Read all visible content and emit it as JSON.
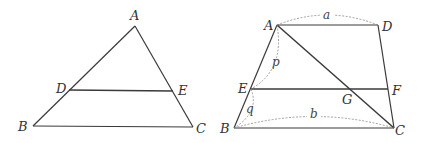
{
  "figures": [
    {
      "name": "triangle-ABC",
      "points": {
        "A": [
          135,
          26
        ],
        "B": [
          33,
          126
        ],
        "C": [
          193,
          127
        ],
        "D": [
          69,
          90
        ],
        "E": [
          173,
          91
        ]
      },
      "labels": {
        "A": "A",
        "B": "B",
        "C": "C",
        "D": "D",
        "E": "E"
      },
      "segments": [
        [
          "A",
          "B"
        ],
        [
          "A",
          "C"
        ],
        [
          "B",
          "C"
        ],
        [
          "D",
          "E"
        ]
      ]
    },
    {
      "name": "trapezoid-ABCD",
      "points": {
        "A": [
          277,
          25
        ],
        "D": [
          378,
          25
        ],
        "B": [
          234,
          128
        ],
        "C": [
          394,
          128
        ],
        "E": [
          251,
          89
        ],
        "F": [
          388,
          89
        ],
        "G": [
          352,
          89
        ]
      },
      "labels": {
        "A": "A",
        "B": "B",
        "C": "C",
        "D": "D",
        "E": "E",
        "F": "F",
        "G": "G"
      },
      "segments": [
        [
          "A",
          "D"
        ],
        [
          "A",
          "B"
        ],
        [
          "D",
          "C"
        ],
        [
          "B",
          "C"
        ],
        [
          "E",
          "F"
        ],
        [
          "A",
          "C"
        ]
      ],
      "dimensions": {
        "a": "a",
        "b": "b",
        "p": "p",
        "q": "q"
      }
    }
  ],
  "colors": {
    "line": "#3a3a3a",
    "dashed": "#888888",
    "text": "#333333"
  }
}
